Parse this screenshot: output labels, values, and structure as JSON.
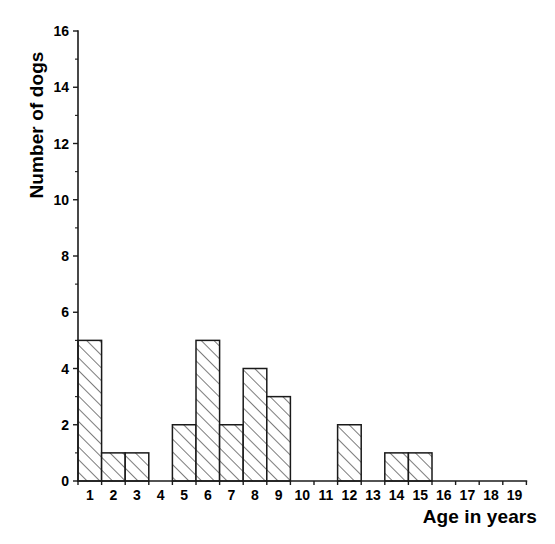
{
  "chart_data": {
    "type": "bar",
    "title": "",
    "subtitle": "",
    "xlabel": "Age in years",
    "ylabel": "Number of dogs",
    "categories": [
      "1",
      "2",
      "3",
      "4",
      "5",
      "6",
      "7",
      "8",
      "9",
      "10",
      "11",
      "12",
      "13",
      "14",
      "15",
      "16",
      "17",
      "18",
      "19"
    ],
    "values": [
      5,
      1,
      1,
      0,
      2,
      5,
      2,
      4,
      3,
      0,
      0,
      2,
      0,
      1,
      1,
      0,
      0,
      0,
      0
    ],
    "xlim": [
      0,
      19
    ],
    "ylim": [
      0,
      16
    ],
    "y_major_ticks": [
      0,
      2,
      4,
      6,
      8,
      10,
      12,
      14,
      16
    ],
    "y_minor_ticks": [
      1,
      3,
      5,
      7,
      9,
      11,
      13,
      15
    ],
    "y_tick_labels": [
      "0",
      "2",
      "4",
      "6",
      "8",
      "10",
      "12",
      "14",
      "16"
    ],
    "x_tick_labels": [
      "1",
      "2",
      "3",
      "4",
      "5",
      "6",
      "7",
      "8",
      "9",
      "10",
      "11",
      "12",
      "13",
      "14",
      "15",
      "16",
      "17",
      "18",
      "19"
    ],
    "grid": false,
    "legend": false,
    "legend_position": "none",
    "bar_fill": "hatch-diagonal-45",
    "bar_edge_color": "#1a1a1a",
    "background_color": "#ffffff",
    "annotations": []
  }
}
